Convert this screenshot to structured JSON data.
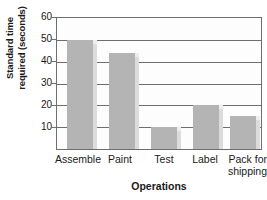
{
  "chart_data": {
    "type": "bar",
    "title": "",
    "subtitle": "",
    "xlabel": "Operations",
    "ylabel": "Standard time required (seconds)",
    "ylabel_lines": [
      "Standard time",
      "required (seconds)"
    ],
    "categories": [
      "Assemble",
      "Paint",
      "Test",
      "Label",
      "Pack for shipping"
    ],
    "category_label_lines": [
      [
        "Assemble"
      ],
      [
        "Paint"
      ],
      [
        "Test"
      ],
      [
        "Label"
      ],
      [
        "Pack for",
        "shipping"
      ]
    ],
    "values": [
      50,
      44,
      10,
      20,
      15
    ],
    "ylim": [
      0,
      60
    ],
    "yticks": [
      10,
      20,
      30,
      40,
      50,
      60
    ],
    "ytick_labels": [
      "10",
      "20",
      "30",
      "40",
      "50",
      "60"
    ],
    "grid": true,
    "grid_axis": "y",
    "legend": false,
    "legend_position": "none",
    "bar_color": "#b4b4b4",
    "bar_shadow_color": "#dcdcdc",
    "axis_color": "#6e6e6e",
    "plot_background": "#fdfdfd",
    "text_color": "#1a1a1a"
  }
}
